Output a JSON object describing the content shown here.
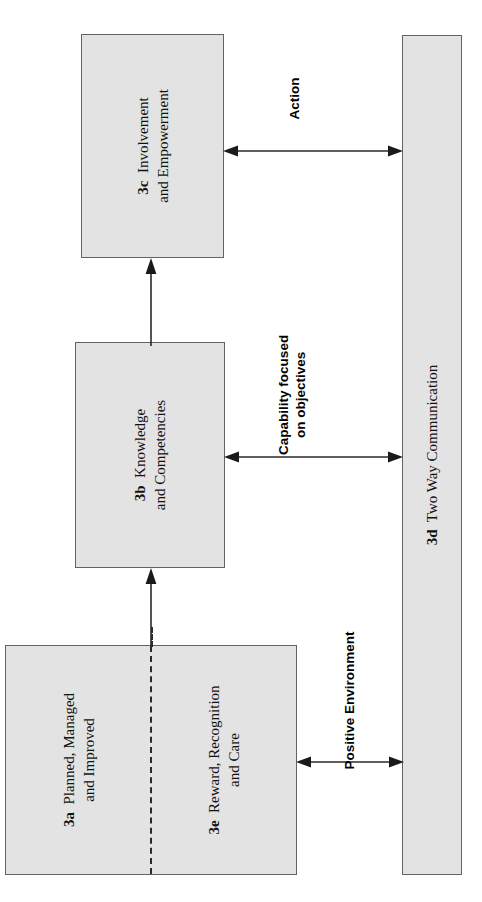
{
  "diagram": {
    "nodes": {
      "box_3c": {
        "code": "3c",
        "line1": "Involvement",
        "line2": "and Empowerment",
        "full_text": "3c  Involvement and Empowerment"
      },
      "box_3b": {
        "code": "3b",
        "line1": "Knowledge",
        "line2": "and Competencies",
        "full_text": "3b  Knowledge and Competencies"
      },
      "box_3a": {
        "code": "3a",
        "line1": "Planned, Managed",
        "line2": "and Improved",
        "full_text": "3a  Planned, Managed and Improved"
      },
      "box_3e": {
        "code": "3e",
        "line1": "Reward, Recognition",
        "line2": "and Care",
        "full_text": "3e  Reward, Recognition and Care"
      },
      "bar_3d": {
        "code": "3d",
        "line1": "Two Way Communication",
        "full_text": "3d Two Way Communication"
      }
    },
    "connectors": {
      "action": {
        "label_line1": "Action",
        "label_line2": "",
        "style": "double-headed",
        "from": "3c",
        "to": "3d"
      },
      "capability": {
        "label_line1": "Capability focused",
        "label_line2": "on objectives",
        "style": "double-headed",
        "from": "3b",
        "to": "3d"
      },
      "positive": {
        "label_line1": "Positive Environment",
        "label_line2": "",
        "style": "double-headed",
        "from": "3a/3e",
        "to": "3d"
      },
      "up_3ae_to_3b": {
        "style": "single-headed-up",
        "from": "3a/3e",
        "to": "3b"
      },
      "up_3b_to_3c": {
        "style": "single-headed-up",
        "from": "3b",
        "to": "3c"
      }
    },
    "colors": {
      "box_fill": "#e3e3e3",
      "box_border": "#636363",
      "line": "#2a2a2a",
      "text": "#111111",
      "background": "#ffffff"
    }
  }
}
